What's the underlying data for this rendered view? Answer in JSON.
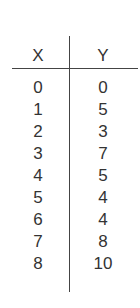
{
  "table": {
    "headers": {
      "x": "X",
      "y": "Y"
    },
    "rows": [
      {
        "x": "0",
        "y": "0"
      },
      {
        "x": "1",
        "y": "5"
      },
      {
        "x": "2",
        "y": "3"
      },
      {
        "x": "3",
        "y": "7"
      },
      {
        "x": "4",
        "y": "5"
      },
      {
        "x": "5",
        "y": "4"
      },
      {
        "x": "6",
        "y": "4"
      },
      {
        "x": "7",
        "y": "8"
      },
      {
        "x": "8",
        "y": "10"
      }
    ]
  },
  "chart_data": {
    "type": "table",
    "columns": [
      "X",
      "Y"
    ],
    "x": [
      0,
      1,
      2,
      3,
      4,
      5,
      6,
      7,
      8
    ],
    "values": [
      0,
      5,
      3,
      7,
      5,
      4,
      4,
      8,
      10
    ]
  },
  "colors": {
    "text": "#333333",
    "rule": "#444444",
    "background": "#ffffff"
  }
}
